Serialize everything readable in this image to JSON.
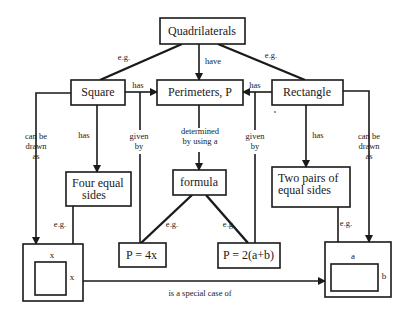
{
  "diagram": {
    "nodes": {
      "quadrilaterals": "Quadrilaterals",
      "square": "Square",
      "perimeters": "Perimeters, P",
      "rectangle": "Rectangle",
      "four_equal_sides": [
        "Four equal",
        "sides"
      ],
      "formula": "formula",
      "two_pairs": [
        "Two pairs of",
        "equal sides"
      ],
      "p_square": "P = 4x",
      "p_rect": "P = 2(a+b)",
      "square_drawing": {
        "top_label": "x",
        "side_label": "x"
      },
      "rect_drawing": {
        "top_label": "a",
        "side_label": "b"
      }
    },
    "edges": {
      "quad_to_square": "e.g.",
      "quad_to_rect": "e.g.",
      "quad_to_perim": "have",
      "square_to_perim": "has",
      "rect_to_perim": "has",
      "square_drawn": [
        "can be",
        "drawn",
        "as"
      ],
      "rect_drawn": [
        "can be",
        "drawn",
        "as"
      ],
      "square_has": "has",
      "rect_has": "has",
      "square_given_by": [
        "given",
        "by"
      ],
      "rect_given_by": [
        "given",
        "by"
      ],
      "perim_determined": [
        "determined",
        "by using a"
      ],
      "formula_eg_left": "e.g.",
      "formula_eg_right": "e.g.",
      "four_eg": "e.g.",
      "two_eg": "e.g.",
      "special_case": "is a special case of"
    }
  }
}
